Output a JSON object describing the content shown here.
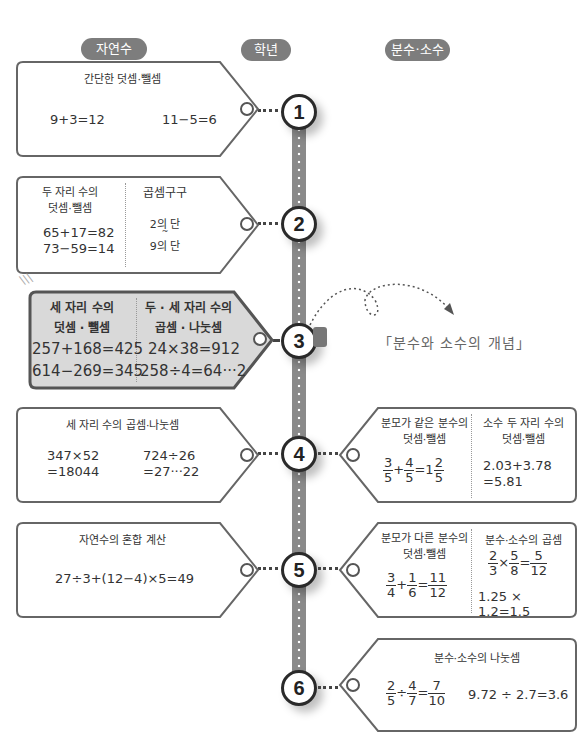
{
  "headers": {
    "left": "자연수",
    "center": "학년",
    "right": "분수·소수"
  },
  "grades": [
    "1",
    "2",
    "3",
    "4",
    "5",
    "6"
  ],
  "colors": {
    "pill": "#7d7d7d",
    "spine": "#8a8a8a",
    "highlight_tag": "#d9d9d9",
    "border": "#555555"
  },
  "natural": {
    "g1": {
      "title": "간단한 덧셈·뺄셈",
      "eq1": "9+3=12",
      "eq2": "11−5=6"
    },
    "g2": {
      "col1_title_line1": "두 자리 수의",
      "col1_title_line2": "덧셈·뺄셈",
      "col1_eq1": "65+17=82",
      "col1_eq2": "73−59=14",
      "col2_title": "곱셈구구",
      "col2_line1": "2의 단",
      "col2_line2": "~",
      "col2_line3": "9의 단"
    },
    "g3": {
      "col1_title_line1": "세 자리 수의",
      "col1_title_line2": "덧셈 · 뺄셈",
      "col1_eq1": "257+168=425",
      "col1_eq2": "614−269=345",
      "col2_title_line1": "두 · 세 자리 수의",
      "col2_title_line2": "곱셈 · 나눗셈",
      "col2_eq1": "24×38=912",
      "col2_eq2": "258÷4=64···2"
    },
    "g4": {
      "title": "세 자리 수의 곱셈·나눗셈",
      "eq1_line1": "347×52",
      "eq1_line2": "=18044",
      "eq2_line1": "724÷26",
      "eq2_line2": "=27···22"
    },
    "g5": {
      "title": "자연수의 혼합 계산",
      "eq": "27÷3+(12−4)×5=49"
    }
  },
  "fraction": {
    "concept_note": "「분수와 소수의 개념」",
    "g4": {
      "col1_title_line1": "분모가 같은 분수의",
      "col1_title_line2": "덧셈·뺄셈",
      "col1_eq": {
        "a_n": "3",
        "a_d": "5",
        "op": "+",
        "b_n": "4",
        "b_d": "5",
        "eq": "=1",
        "r_n": "2",
        "r_d": "5"
      },
      "col2_title_line1": "소수 두 자리 수의",
      "col2_title_line2": "덧셈·뺄셈",
      "col2_eq_line1": "2.03+3.78",
      "col2_eq_line2": "=5.81"
    },
    "g5": {
      "col1_title_line1": "분모가 다른 분수의",
      "col1_title_line2": "덧셈·뺄셈",
      "col1_eq": {
        "a_n": "3",
        "a_d": "4",
        "op": "+",
        "b_n": "1",
        "b_d": "6",
        "eq": "=",
        "r_n": "11",
        "r_d": "12"
      },
      "col2_title": "분수·소수의 곱셈",
      "col2_eq1": {
        "a_n": "2",
        "a_d": "3",
        "op": "×",
        "b_n": "5",
        "b_d": "8",
        "eq": "=",
        "r_n": "5",
        "r_d": "12"
      },
      "col2_eq2": "1.25 × 1.2=1.5"
    },
    "g6": {
      "title": "분수·소수의 나눗셈",
      "eq1": {
        "a_n": "2",
        "a_d": "5",
        "op": "÷",
        "b_n": "4",
        "b_d": "7",
        "eq": "=",
        "r_n": "7",
        "r_d": "10"
      },
      "eq2": "9.72 ÷ 2.7=3.6"
    }
  }
}
